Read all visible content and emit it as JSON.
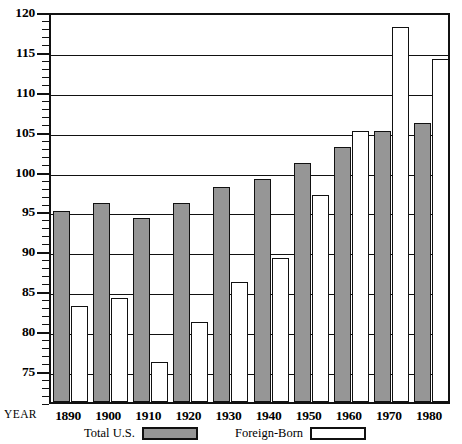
{
  "chart_data": {
    "type": "bar",
    "title": "",
    "subtitle": "",
    "xlabel": "YEAR",
    "ylabel": "",
    "categories": [
      "1890",
      "1900",
      "1910",
      "1920",
      "1930",
      "1940",
      "1950",
      "1960",
      "1970",
      "1980"
    ],
    "series": [
      {
        "name": "Total U.S.",
        "values": [
          95,
          96,
          94,
          96,
          98,
          99,
          101,
          103,
          105,
          106
        ],
        "color": "#969696"
      },
      {
        "name": "Foreign-Born",
        "values": [
          83,
          84,
          76,
          81,
          86,
          89,
          97,
          105,
          118,
          114
        ],
        "color": "#ffffff"
      }
    ],
    "ylim": [
      71,
      120
    ],
    "y_major_ticks": [
      75,
      80,
      85,
      90,
      95,
      100,
      105,
      110,
      115,
      120
    ],
    "y_minor_tick_step": 1,
    "gridlines": [
      75,
      80,
      85,
      90,
      95,
      100,
      105,
      110,
      115
    ],
    "grid": true,
    "legend_position": "bottom"
  },
  "axis": {
    "y_tick_labels": [
      "120",
      "115",
      "110",
      "105",
      "100",
      "95",
      "90",
      "85",
      "80",
      "75"
    ],
    "year_label": "YEAR",
    "year_ticks": [
      "1890",
      "1900",
      "1910",
      "1920",
      "1930",
      "1940",
      "1950",
      "1960",
      "1970",
      "1980"
    ]
  },
  "legend": {
    "items": [
      {
        "label": "Total U.S.",
        "swatch": "filled-gray-swatch"
      },
      {
        "label": "Foreign-Born",
        "swatch": "empty-white-swatch"
      }
    ]
  }
}
